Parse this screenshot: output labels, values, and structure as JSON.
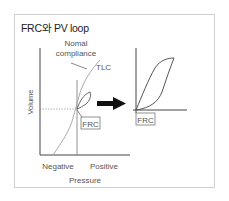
{
  "title": "FRC와 PV loop",
  "left_chart": {
    "y_axis_label": "Volume",
    "x_axis_label": "Pressure",
    "x_tick_labels": [
      "Negative",
      "Positive"
    ],
    "annotations": {
      "curve_label": "Normal compliance",
      "curve_label_line1": "Nomal",
      "curve_label_line2": "compliance",
      "top_label": "TLC",
      "point_label": "FRC"
    }
  },
  "right_chart": {
    "annotation": "FRC"
  },
  "arrow": "right-arrow",
  "colors": {
    "axis": "#444444",
    "curve": "#9a9a9a",
    "loop": "#555555",
    "frame": "#cfcfcf",
    "arrow": "#111111",
    "text": "#555555"
  }
}
